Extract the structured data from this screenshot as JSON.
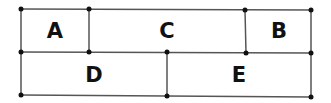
{
  "diagram": {
    "line_color": "#555555",
    "dot_color": "#111111",
    "regions": [
      {
        "id": "A",
        "label": "A",
        "x": 55,
        "y": 31
      },
      {
        "id": "C",
        "label": "C",
        "x": 167,
        "y": 31
      },
      {
        "id": "B",
        "label": "B",
        "x": 279,
        "y": 31
      },
      {
        "id": "D",
        "label": "D",
        "x": 94,
        "y": 75
      },
      {
        "id": "E",
        "label": "E",
        "x": 239,
        "y": 75
      }
    ]
  }
}
